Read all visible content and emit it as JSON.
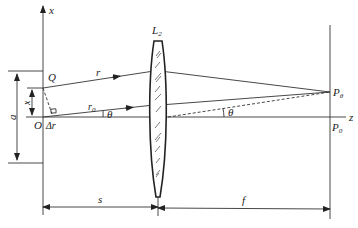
{
  "diagram": {
    "type": "optics-lens-diffraction",
    "labels": {
      "x_axis": "x",
      "z_axis": "z",
      "lens": "L",
      "lens_sub": "2",
      "point_Q": "Q",
      "origin": "O",
      "ray_r": "r",
      "ray_r0": "r",
      "ray_r0_sub": "0",
      "theta_left": "θ",
      "theta_right": "θ",
      "delta_r": "Δr",
      "dim_x": "x",
      "dim_a": "a",
      "dim_s": "s",
      "dim_f": "f",
      "point_P_theta": "P",
      "point_P_theta_sub": "θ",
      "point_P0": "P",
      "point_P0_sub": "0"
    },
    "colors": {
      "line": "#333333",
      "text": "#222222",
      "background": "#ffffff"
    }
  }
}
